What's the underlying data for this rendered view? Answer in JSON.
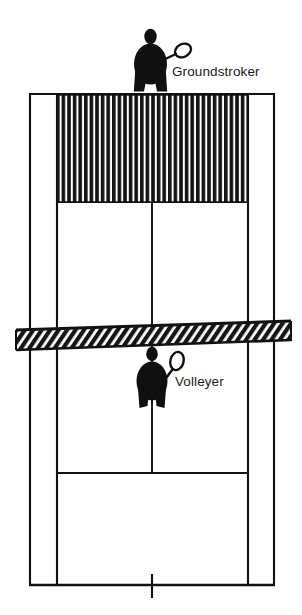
{
  "diagram": {
    "type": "tennis-court-schematic",
    "colors": {
      "ink": "#111111",
      "paper": "#ffffff",
      "label": "#1a1a1a"
    },
    "labels": [
      {
        "id": "groundstroker",
        "text": "Groundstroker"
      },
      {
        "id": "volleyer",
        "text": "Volleyer"
      }
    ],
    "players": [
      {
        "id": "groundstroker",
        "role": "Groundstroker",
        "side": "far",
        "position_description": "standing behind the far baseline at the center mark",
        "racket": "held out to the player's right"
      },
      {
        "id": "volleyer",
        "role": "Volleyer",
        "side": "near",
        "position_description": "standing just behind the net on the near side at the center",
        "racket": "held up to the player's right"
      }
    ],
    "court_features": {
      "net": "hatched band across the middle of the court",
      "shaded_zone": "vertically hatched rectangle covering the far service boxes area behind the far service line",
      "lines": [
        "doubles sidelines",
        "singles sidelines",
        "far baseline",
        "near baseline",
        "far service line",
        "near service line",
        "center service line",
        "center marks"
      ]
    }
  }
}
